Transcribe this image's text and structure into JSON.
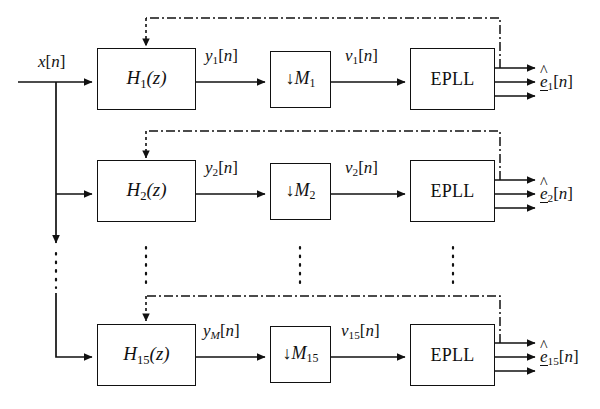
{
  "diagram": {
    "input": {
      "label": "x[n]"
    },
    "ellipsis_note": "vertical dotted ellipsis indicating omitted channels 3 through 14",
    "line_color": "#111111",
    "background": "#ffffff",
    "rows": [
      {
        "index": "1",
        "filter_label": "H",
        "filter_sub": "1",
        "filter_arg": "(z)",
        "filter_text": "H1(z)",
        "filter_out_label": "y",
        "filter_out_sub": "1",
        "filter_out_text": "y1[n]",
        "decimator_label": "M",
        "decimator_sub": "1",
        "decimator_text": "M1",
        "decimator_out_label": "v",
        "decimator_out_sub": "1",
        "decimator_out_text": "v1[n]",
        "pll_label": "EPLL",
        "output_label": "e",
        "output_sub": "1",
        "output_text": "e1[n]"
      },
      {
        "index": "2",
        "filter_label": "H",
        "filter_sub": "2",
        "filter_arg": "(z)",
        "filter_text": "H2(z)",
        "filter_out_label": "y",
        "filter_out_sub": "2",
        "filter_out_text": "y2[n]",
        "decimator_label": "M",
        "decimator_sub": "2",
        "decimator_text": "M2",
        "decimator_out_label": "v",
        "decimator_out_sub": "2",
        "decimator_out_text": "v2[n]",
        "pll_label": "EPLL",
        "output_label": "e",
        "output_sub": "2",
        "output_text": "e2[n]"
      },
      {
        "index": "15",
        "filter_label": "H",
        "filter_sub": "15",
        "filter_arg": "(z)",
        "filter_text": "H15(z)",
        "filter_out_label": "y",
        "filter_out_sub": "M",
        "filter_out_text": "yM[n]",
        "decimator_label": "M",
        "decimator_sub": "15",
        "decimator_text": "M15",
        "decimator_out_label": "v",
        "decimator_out_sub": "15",
        "decimator_out_text": "v15[n]",
        "pll_label": "EPLL",
        "output_label": "e",
        "output_sub": "15",
        "output_text": "e15[n]"
      }
    ]
  }
}
